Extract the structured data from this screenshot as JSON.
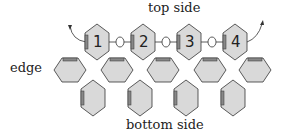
{
  "labels": {
    "top": "top side",
    "edge": "edge",
    "bottom": "bottom side"
  },
  "beads_top_row": [
    "1",
    "2",
    "3",
    "4"
  ],
  "colors": {
    "bead_fill": "#d9d9d9",
    "outline": "#333333"
  }
}
